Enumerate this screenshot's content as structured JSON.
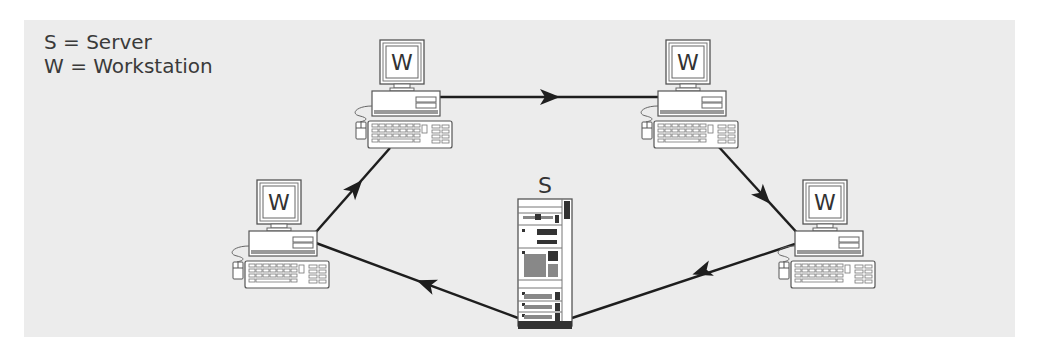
{
  "legend": {
    "items": [
      {
        "key": "S",
        "label": "Server",
        "text": "S = Server"
      },
      {
        "key": "W",
        "label": "Workstation",
        "text": "W = Workstation"
      }
    ]
  },
  "nodes": {
    "server": {
      "letter": "S",
      "type": "server"
    },
    "workstations": [
      {
        "id": "ws-top-left",
        "letter": "W"
      },
      {
        "id": "ws-top-right",
        "letter": "W"
      },
      {
        "id": "ws-right",
        "letter": "W"
      },
      {
        "id": "ws-left",
        "letter": "W"
      }
    ]
  },
  "connections": [
    {
      "from": "ws-top-left",
      "to": "ws-top-right",
      "directed": true
    },
    {
      "from": "ws-top-right",
      "to": "ws-right",
      "directed": true
    },
    {
      "from": "ws-right",
      "to": "server",
      "directed": true
    },
    {
      "from": "server",
      "to": "ws-left",
      "directed": true
    },
    {
      "from": "ws-left",
      "to": "ws-top-left",
      "directed": true
    }
  ],
  "colors": {
    "background": "#ececec",
    "line": "#1e1e1e",
    "outline": "#555555",
    "device_fill": "#ffffff"
  }
}
